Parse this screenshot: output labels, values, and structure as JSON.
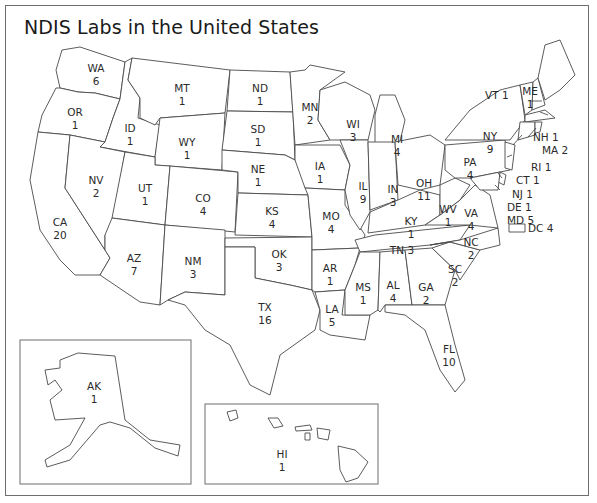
{
  "title": "NDIS Labs in the United States",
  "colors": {
    "border": "#4a4a4a",
    "frame": "#6e6e6e",
    "background": "#ffffff",
    "text": "#2a2a2a"
  },
  "states": [
    {
      "abbr": "WA",
      "count": "6"
    },
    {
      "abbr": "OR",
      "count": "1"
    },
    {
      "abbr": "CA",
      "count": "20"
    },
    {
      "abbr": "ID",
      "count": "1"
    },
    {
      "abbr": "NV",
      "count": "2"
    },
    {
      "abbr": "MT",
      "count": "1"
    },
    {
      "abbr": "WY",
      "count": "1"
    },
    {
      "abbr": "UT",
      "count": "1"
    },
    {
      "abbr": "AZ",
      "count": "7"
    },
    {
      "abbr": "CO",
      "count": "4"
    },
    {
      "abbr": "NM",
      "count": "3"
    },
    {
      "abbr": "ND",
      "count": "1"
    },
    {
      "abbr": "SD",
      "count": "1"
    },
    {
      "abbr": "NE",
      "count": "1"
    },
    {
      "abbr": "KS",
      "count": "4"
    },
    {
      "abbr": "OK",
      "count": "3"
    },
    {
      "abbr": "TX",
      "count": "16"
    },
    {
      "abbr": "MN",
      "count": "2"
    },
    {
      "abbr": "IA",
      "count": "1"
    },
    {
      "abbr": "MO",
      "count": "4"
    },
    {
      "abbr": "AR",
      "count": "1"
    },
    {
      "abbr": "LA",
      "count": "5"
    },
    {
      "abbr": "WI",
      "count": "3"
    },
    {
      "abbr": "IL",
      "count": "9"
    },
    {
      "abbr": "MI",
      "count": "4"
    },
    {
      "abbr": "IN",
      "count": "3"
    },
    {
      "abbr": "OH",
      "count": "11"
    },
    {
      "abbr": "KY",
      "count": "1"
    },
    {
      "abbr": "TN",
      "count": "3"
    },
    {
      "abbr": "MS",
      "count": "1"
    },
    {
      "abbr": "AL",
      "count": "4"
    },
    {
      "abbr": "GA",
      "count": "2"
    },
    {
      "abbr": "FL",
      "count": "10"
    },
    {
      "abbr": "SC",
      "count": "2"
    },
    {
      "abbr": "NC",
      "count": "2"
    },
    {
      "abbr": "VA",
      "count": "4"
    },
    {
      "abbr": "WV",
      "count": "1"
    },
    {
      "abbr": "PA",
      "count": "4"
    },
    {
      "abbr": "NY",
      "count": "9"
    },
    {
      "abbr": "VT",
      "count": "1"
    },
    {
      "abbr": "ME",
      "count": "1"
    },
    {
      "abbr": "NH",
      "count": "1"
    },
    {
      "abbr": "MA",
      "count": "2"
    },
    {
      "abbr": "RI",
      "count": "1"
    },
    {
      "abbr": "CT",
      "count": "1"
    },
    {
      "abbr": "NJ",
      "count": "1"
    },
    {
      "abbr": "DE",
      "count": "1"
    },
    {
      "abbr": "MD",
      "count": "5"
    },
    {
      "abbr": "DC",
      "count": "4"
    },
    {
      "abbr": "AK",
      "count": "1"
    },
    {
      "abbr": "HI",
      "count": "1"
    }
  ]
}
